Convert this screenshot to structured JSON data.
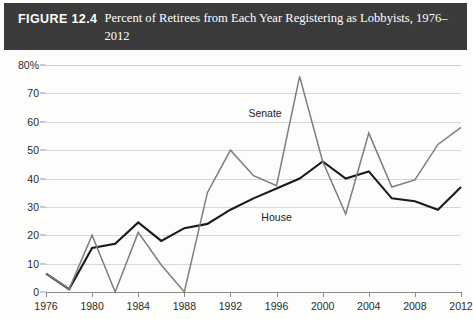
{
  "header": {
    "figure_label": "FIGURE 12.4",
    "title": "Percent of Retirees from Each Year Registering as Lobbyists, 1976–2012",
    "bar_color": "#3b3b3b"
  },
  "chart_data": {
    "type": "line",
    "title": "Percent of Retirees from Each Year Registering as Lobbyists, 1976–2012",
    "xlabel": "",
    "ylabel": "",
    "xlim": [
      1976,
      2012
    ],
    "ylim": [
      0,
      80
    ],
    "grid": true,
    "legend": "inline-labels",
    "y_ticks": [
      0,
      10,
      20,
      30,
      40,
      50,
      60,
      70,
      80
    ],
    "y_tick_labels": [
      "0",
      "10",
      "20",
      "30",
      "40",
      "50",
      "60",
      "70",
      "80%"
    ],
    "x_ticks": [
      1976,
      1980,
      1984,
      1988,
      1992,
      1996,
      2000,
      2004,
      2008,
      2012
    ],
    "x_tick_labels": [
      "1976",
      "1980",
      "1984",
      "1988",
      "1992",
      "1996",
      "2000",
      "2004",
      "2008",
      "2012"
    ],
    "x": [
      1976,
      1978,
      1980,
      1982,
      1984,
      1986,
      1988,
      1990,
      1992,
      1994,
      1996,
      1998,
      2000,
      2002,
      2004,
      2006,
      2008,
      2010,
      2012
    ],
    "series": [
      {
        "name": "House",
        "color": "#1a1a1a",
        "width": 2.1,
        "values": [
          6.5,
          1.0,
          15.5,
          17.0,
          24.5,
          18.0,
          22.5,
          24.0,
          29.0,
          33.0,
          36.5,
          40.0,
          46.0,
          40.0,
          42.5,
          33.0,
          32.0,
          29.0,
          37.0
        ],
        "label_x": 1996,
        "label_y": 26.5
      },
      {
        "name": "Senate",
        "color": "#7d7d7d",
        "width": 1.5,
        "values": [
          6.5,
          1.0,
          20.0,
          0.0,
          21.0,
          9.5,
          0.0,
          35.0,
          50.0,
          41.0,
          37.5,
          76.0,
          46.0,
          27.5,
          56.0,
          37.0,
          39.5,
          52.0,
          58.0
        ],
        "label_x": 1995,
        "label_y": 63.0
      }
    ]
  }
}
